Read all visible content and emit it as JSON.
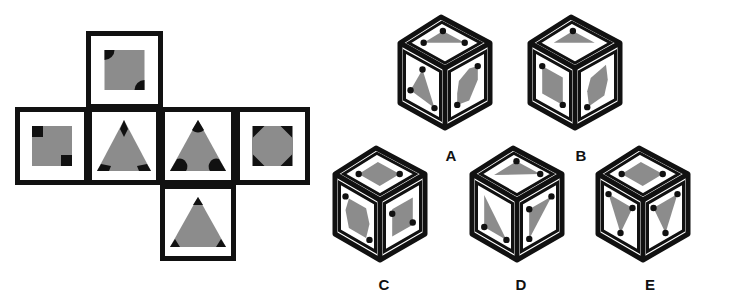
{
  "colors": {
    "background": "#ffffff",
    "outline": "#111111",
    "fill": "#8c8c8c",
    "mark": "#111111"
  },
  "net": {
    "faces": [
      {
        "id": "top",
        "x": 86,
        "y": 31,
        "w": 77,
        "h": 78,
        "shape": "square",
        "marks": "quarter-circles-tl-br"
      },
      {
        "id": "left",
        "x": 15,
        "y": 107,
        "w": 74,
        "h": 78,
        "shape": "square",
        "marks": "squares-tl-br"
      },
      {
        "id": "center",
        "x": 87,
        "y": 107,
        "w": 74,
        "h": 78,
        "shape": "triangle",
        "marks": "diamonds"
      },
      {
        "id": "right1",
        "x": 160,
        "y": 107,
        "w": 76,
        "h": 78,
        "shape": "triangle",
        "marks": "semicircles"
      },
      {
        "id": "right2",
        "x": 235,
        "y": 107,
        "w": 75,
        "h": 78,
        "shape": "octagon",
        "marks": "corner-triangles"
      },
      {
        "id": "bottom",
        "x": 160,
        "y": 184,
        "w": 76,
        "h": 77,
        "shape": "triangle",
        "marks": "corner-tri-small"
      }
    ]
  },
  "options": [
    {
      "label": "A",
      "label_x": 451,
      "label_y": 155,
      "top": [
        441,
        17
      ],
      "cx": 445,
      "cy": 68
    },
    {
      "label": "B",
      "label_x": 581,
      "label_y": 155,
      "top": [
        571,
        17
      ],
      "cx": 575,
      "cy": 68
    },
    {
      "label": "C",
      "label_x": 384,
      "label_y": 284,
      "top": [
        376,
        148
      ],
      "cx": 380,
      "cy": 200
    },
    {
      "label": "D",
      "label_x": 521,
      "label_y": 284,
      "top": [
        513,
        148
      ],
      "cx": 517,
      "cy": 200
    },
    {
      "label": "E",
      "label_x": 650,
      "label_y": 284,
      "top": [
        639,
        148
      ],
      "cx": 643,
      "cy": 200
    }
  ]
}
